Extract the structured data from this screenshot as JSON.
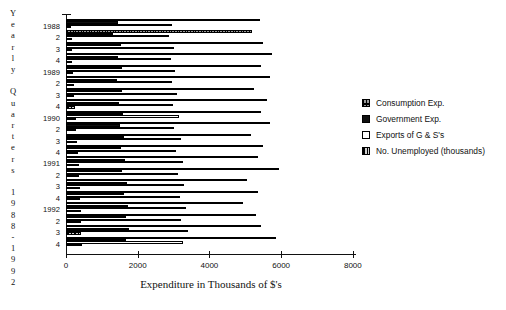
{
  "chart_data": {
    "type": "bar",
    "orientation": "horizontal",
    "title": "",
    "xlabel": "Expenditure in Thousands of $'s",
    "ylabel": "Yearly Quarters 1988 - 1992",
    "xlim": [
      0,
      8000
    ],
    "xticks": [
      0,
      2000,
      4000,
      6000,
      8000
    ],
    "xticklabels": [
      "0",
      "2000",
      "4000",
      "6000",
      "8000"
    ],
    "grid": false,
    "legend_position": "right",
    "categories": [
      "1988",
      "2",
      "3",
      "4",
      "1989",
      "2",
      "3",
      "4",
      "1990",
      "2",
      "3",
      "4",
      "1991",
      "2",
      "3",
      "4",
      "1992",
      "2",
      "3",
      "4"
    ],
    "series": [
      {
        "name": "Consumption Exp.",
        "pattern": "light-checkered",
        "values": [
          5400,
          5200,
          5500,
          5750,
          5450,
          5700,
          5250,
          5600,
          5450,
          5700,
          5150,
          5500,
          5350,
          5950,
          5050,
          5350,
          4950,
          5300,
          5450,
          5850
        ]
      },
      {
        "name": "Government Exp.",
        "pattern": "solid-black",
        "values": [
          1450,
          1320,
          1530,
          1450,
          1550,
          1430,
          1560,
          1470,
          1600,
          1500,
          1630,
          1530,
          1650,
          1570,
          1700,
          1620,
          1720,
          1660,
          1750,
          1680
        ]
      },
      {
        "name": "Exports of G & S's",
        "pattern": "white",
        "values": [
          2950,
          2880,
          3000,
          2940,
          3050,
          2960,
          3100,
          2980,
          3150,
          3020,
          3200,
          3080,
          3250,
          3120,
          3300,
          3180,
          3350,
          3220,
          3400,
          3250
        ]
      },
      {
        "name": "No. Unemployed (thousands)",
        "pattern": "dark-checkered",
        "values": [
          150,
          160,
          175,
          180,
          200,
          215,
          230,
          250,
          270,
          290,
          310,
          330,
          350,
          365,
          380,
          395,
          410,
          420,
          430,
          440
        ]
      }
    ]
  },
  "y_axis_title_letters": [
    "Y",
    "e",
    "a",
    "r",
    "l",
    "y",
    "",
    "Q",
    "u",
    "a",
    "r",
    "t",
    "e",
    "r",
    "s",
    "",
    "1",
    "9",
    "8",
    "8",
    "-",
    "1",
    "9",
    "9",
    "2"
  ],
  "legend": {
    "items": [
      {
        "label": "Consumption Exp.",
        "swatch": "light-checkered"
      },
      {
        "label": "Government Exp.",
        "swatch": "solid-black"
      },
      {
        "label": "Exports of G & S's",
        "swatch": "white"
      },
      {
        "label": "No. Unemployed (thousands)",
        "swatch": "dark-checkered"
      }
    ]
  },
  "colors": {
    "axis": "#111111",
    "consumption": "#9a9a9a",
    "government": "#101010",
    "exports": "#ffffff",
    "unemployed": "#3a3a3a",
    "background": "#ffffff"
  }
}
